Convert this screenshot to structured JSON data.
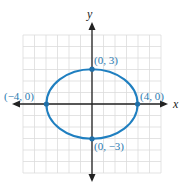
{
  "chart_data": {
    "type": "line",
    "title": "",
    "xlabel": "x",
    "ylabel": "y",
    "xlim": [
      -6,
      6
    ],
    "ylim": [
      -6,
      6
    ],
    "grid": true,
    "curve": "ellipse x^2/16 + y^2/9 = 1",
    "series": [
      {
        "name": "ellipse",
        "color": "#1f7fc0",
        "center": [
          0,
          0
        ],
        "a": 4,
        "b": 3,
        "points": [
          {
            "x": 0,
            "y": 3,
            "label": "(0, 3)"
          },
          {
            "x": 4,
            "y": 0,
            "label": "(4, 0)"
          },
          {
            "x": 0,
            "y": -3,
            "label": "(0, −3)"
          },
          {
            "x": -4,
            "y": 0,
            "label": "(−4, 0)"
          }
        ]
      }
    ]
  },
  "labels": {
    "x_axis": "x",
    "y_axis": "y",
    "top": "(0, 3)",
    "right": "(4, 0)",
    "bottom": "(0, −3)",
    "left": "(−4, 0)"
  },
  "colors": {
    "curve": "#1f7fc0",
    "label": "#2a7ab0",
    "grid": "#d9d9d9",
    "axis": "#222222"
  }
}
